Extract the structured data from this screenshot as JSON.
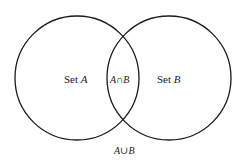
{
  "diagram": {
    "type": "venn",
    "sets": [
      {
        "name": "A",
        "label_prefix": "Set ",
        "label_var": "A",
        "cx": 77,
        "cy": 78,
        "r": 62
      },
      {
        "name": "B",
        "label_prefix": "Set ",
        "label_var": "B",
        "cx": 169,
        "cy": 78,
        "r": 62
      }
    ],
    "intersection_label": {
      "a": "A",
      "op": "∩",
      "b": "B"
    },
    "union_label": {
      "a": "A",
      "op": "∪",
      "b": "B"
    },
    "stroke_color": "#1a1a1a",
    "text_color": "#222222"
  }
}
